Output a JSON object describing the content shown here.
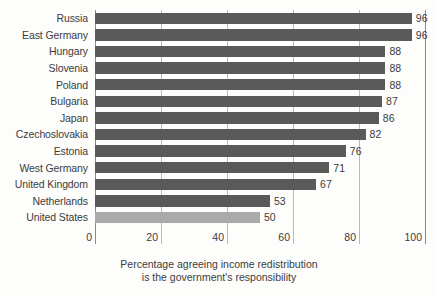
{
  "chart_data": {
    "type": "bar",
    "orientation": "horizontal",
    "title": "",
    "subtitle": "",
    "xlabel": "Percentage agreeing income redistribution is the government's responsibility",
    "ylabel": "",
    "xlim": [
      0,
      100
    ],
    "xticks": [
      0,
      20,
      40,
      60,
      80,
      100
    ],
    "xtick_labels": [
      "0",
      "20",
      "40",
      "60",
      "80",
      "100"
    ],
    "grid": true,
    "grid_axis": "x",
    "legend": false,
    "categories": [
      "Russia",
      "East Germany",
      "Hungary",
      "Slovenia",
      "Poland",
      "Bulgaria",
      "Japan",
      "Czechoslovakia",
      "Estonia",
      "West Germany",
      "United Kingdom",
      "Netherlands",
      "United States"
    ],
    "values": [
      96,
      96,
      88,
      88,
      88,
      87,
      86,
      82,
      76,
      71,
      67,
      53,
      50
    ],
    "value_labels": [
      "96",
      "96",
      "88",
      "88",
      "88",
      "87",
      "86",
      "82",
      "76",
      "71",
      "67",
      "53",
      "50"
    ],
    "bar_colors": [
      "#5a5a5a",
      "#5a5a5a",
      "#5a5a5a",
      "#5a5a5a",
      "#5a5a5a",
      "#5a5a5a",
      "#5a5a5a",
      "#5a5a5a",
      "#5a5a5a",
      "#5a5a5a",
      "#5a5a5a",
      "#5a5a5a",
      "#aaaaaa"
    ],
    "highlighted_category": "United States",
    "colors": {
      "bar_default": "#5a5a5a",
      "bar_highlight": "#aaaaaa",
      "gridline": "#b9b9b9",
      "axis": "#8a8a8a",
      "text": "#3c3c3c",
      "background": "#fdfdfc"
    }
  },
  "caption": {
    "line1": "Percentage agreeing income redistribution",
    "line2": "is the government's responsibility"
  }
}
